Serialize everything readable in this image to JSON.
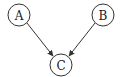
{
  "diagram": {
    "type": "directed-graph",
    "nodes": [
      {
        "id": "A",
        "label": "A",
        "cx": 19,
        "cy": 15,
        "r": 11
      },
      {
        "id": "B",
        "label": "B",
        "cx": 103,
        "cy": 15,
        "r": 11
      },
      {
        "id": "C",
        "label": "C",
        "cx": 61,
        "cy": 65,
        "r": 11
      }
    ],
    "edges": [
      {
        "from": "A",
        "to": "C"
      },
      {
        "from": "B",
        "to": "C"
      }
    ],
    "colors": {
      "stroke": "#333333",
      "background": "#ffffff"
    }
  }
}
